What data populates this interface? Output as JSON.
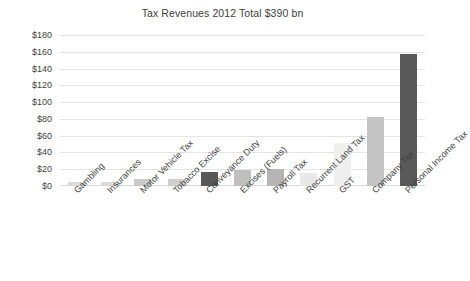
{
  "chart_data": {
    "type": "bar",
    "title": "Tax Revenues 2012 Total $390 bn",
    "xlabel": "",
    "ylabel": "",
    "ylim": [
      0,
      180
    ],
    "ytick_step": 20,
    "grid": true,
    "legend": "none",
    "y_ticks": [
      "$180",
      "$160",
      "$140",
      "$120",
      "$100",
      "$80",
      "$60",
      "$40",
      "$20",
      "$0"
    ],
    "y_tick_values": [
      180,
      160,
      140,
      120,
      100,
      80,
      60,
      40,
      20,
      0
    ],
    "categories": [
      "Gambling",
      "Insurances",
      "Motor Vehicle Tax",
      "Tobacco Excise",
      "Conveyance Duty",
      "Excises (Fuels)",
      "Payroll Tax",
      "Recurrent Land Tax",
      "GST",
      "Company Tax",
      "Personal Income Tax"
    ],
    "values": [
      5,
      5,
      8,
      8,
      17,
      19,
      20,
      16,
      51,
      82,
      157
    ],
    "bar_colors": [
      "#d9d9d9",
      "#d9d9d9",
      "#c9c9c9",
      "#cfcfcf",
      "#595959",
      "#bfbfbf",
      "#b5b5b5",
      "#e8e8e8",
      "#efefef",
      "#c4c4c4",
      "#595959"
    ],
    "units": "$ billions",
    "accent_color": "#595959",
    "grid_color": "#e4e4e4",
    "text_color": "#3f3f3f",
    "background_color": "#ffffff"
  }
}
